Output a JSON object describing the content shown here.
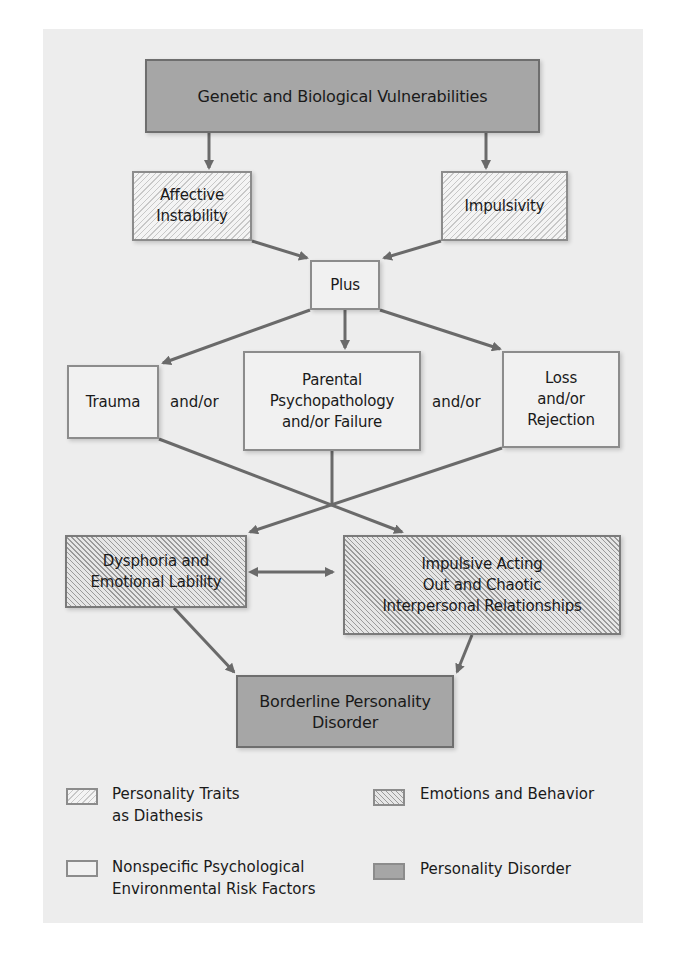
{
  "diagram": {
    "nodes": {
      "genetic": "Genetic and Biological Vulnerabilities",
      "affective": "Affective\nInstability",
      "impulsivity": "Impulsivity",
      "plus": "Plus",
      "trauma": "Trauma",
      "parental": "Parental\nPsychopathology\nand/or Failure",
      "loss": "Loss\nand/or\nRejection",
      "dysphoria": "Dysphoria and\nEmotional Lability",
      "impulsive_acting": "Impulsive Acting\nOut and Chaotic\nInterpersonal Relationships",
      "bpd": "Borderline Personality\nDisorder"
    },
    "connectors": {
      "andor_left": "and/or",
      "andor_right": "and/or"
    },
    "edges": [
      [
        "genetic",
        "affective"
      ],
      [
        "genetic",
        "impulsivity"
      ],
      [
        "affective",
        "plus"
      ],
      [
        "impulsivity",
        "plus"
      ],
      [
        "plus",
        "trauma"
      ],
      [
        "plus",
        "parental"
      ],
      [
        "plus",
        "loss"
      ],
      [
        "trauma",
        "impulsive_acting"
      ],
      [
        "parental",
        "crossing"
      ],
      [
        "loss",
        "dysphoria"
      ],
      [
        "dysphoria",
        "impulsive_acting",
        "bidirectional"
      ],
      [
        "dysphoria",
        "bpd"
      ],
      [
        "impulsive_acting",
        "bpd"
      ]
    ],
    "colors": {
      "panel": "#ededed",
      "dark_fill": "#a6a6a6",
      "line": "#6a6a6a"
    }
  },
  "legend": {
    "items": [
      {
        "pattern": "light-hatch",
        "label": "Personality Traits\nas Diathesis"
      },
      {
        "pattern": "dense-hatch",
        "label": "Emotions and Behavior"
      },
      {
        "pattern": "plain",
        "label": "Nonspecific Psychological\nEnvironmental Risk Factors"
      },
      {
        "pattern": "dark",
        "label": "Personality Disorder"
      }
    ]
  }
}
